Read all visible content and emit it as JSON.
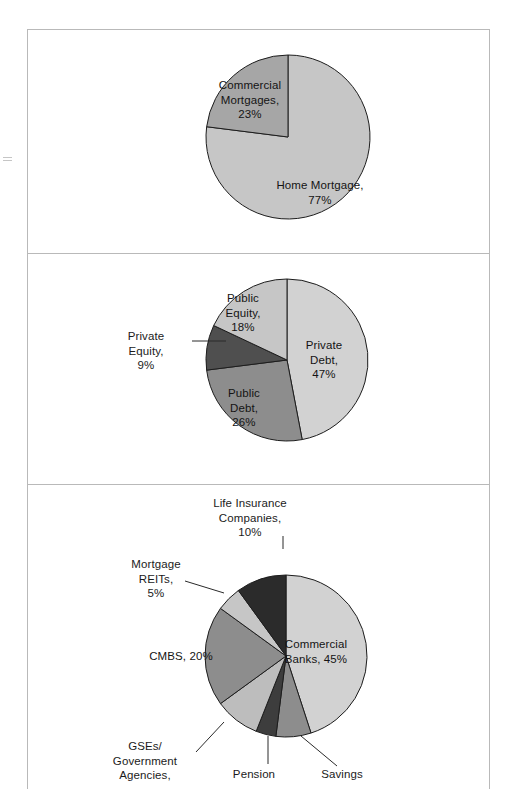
{
  "figure": {
    "background_color": "#ffffff",
    "border_color": "#b9b9b9",
    "panel_count": 3
  },
  "palette": {
    "lightest": "#d2d2d2",
    "light": "#c6c6c6",
    "light_mid": "#bdbdbd",
    "mid": "#a6a6a6",
    "mid_dark": "#8d8d8d",
    "dark": "#6f6f6f",
    "darker": "#4f4f4f",
    "darkest": "#2b2b2b",
    "outline": "#1d1d1d",
    "text": "#1b1b1b"
  },
  "chart_data": [
    {
      "type": "pie",
      "title": "",
      "chart_id": "home-mortgage-vs-commercial",
      "center": [
        260,
        107
      ],
      "radius": 82,
      "start_angle_deg": 0,
      "labels": [
        "Home Mortgage",
        "Commercial Mortgages"
      ],
      "categories": [
        "Home Mortgage",
        "Commercial Mortgages"
      ],
      "values": [
        77,
        23
      ],
      "slices": [
        {
          "label": "Home Mortgage,\n77%",
          "name": "Home Mortgage",
          "value": 77,
          "color": "#c6c6c6",
          "label_position": "inside",
          "label_xy": [
            292,
            148
          ]
        },
        {
          "label": "Commercial\nMortgages,\n23%",
          "name": "Commercial Mortgages",
          "value": 23,
          "color": "#a6a6a6",
          "label_position": "inside",
          "label_xy": [
            222,
            48
          ]
        }
      ]
    },
    {
      "type": "pie",
      "title": "",
      "chart_id": "capital-markets-breakdown",
      "center": [
        259,
        107
      ],
      "radius": 81,
      "start_angle_deg": 0,
      "labels": [
        "Private Debt",
        "Public Debt",
        "Private Equity",
        "Public Equity"
      ],
      "categories": [
        "Private Debt",
        "Public Debt",
        "Private Equity",
        "Public Equity"
      ],
      "values": [
        47,
        26,
        9,
        18
      ],
      "slices": [
        {
          "label": "Private\nDebt,\n47%",
          "name": "Private Debt",
          "value": 47,
          "color": "#d2d2d2",
          "label_position": "inside",
          "label_xy": [
            296,
            85
          ]
        },
        {
          "label": "Public\nDebt,\n26%",
          "name": "Public Debt",
          "value": 26,
          "color": "#8d8d8d",
          "label_position": "inside",
          "label_xy": [
            216,
            133
          ]
        },
        {
          "label": "Private\nEquity,\n9%",
          "name": "Private Equity",
          "value": 9,
          "color": "#4f4f4f",
          "label_position": "outside",
          "label_xy": [
            118,
            76
          ],
          "leader": [
            [
              164,
              88
            ],
            [
              198,
              88
            ]
          ]
        },
        {
          "label": "Public\nEquity,\n18%",
          "name": "Public Equity",
          "value": 18,
          "color": "#c6c6c6",
          "label_position": "inside",
          "label_xy": [
            215,
            38
          ]
        }
      ]
    },
    {
      "type": "pie",
      "title": "",
      "chart_id": "commercial-mortgage-debt-holders",
      "center": [
        258,
        172
      ],
      "radius": 81,
      "start_angle_deg": 0,
      "labels": [
        "Commercial Banks",
        "Savings",
        "Pension",
        "GSEs/Government Agencies",
        "CMBS",
        "Mortgage REITs",
        "Life Insurance Companies"
      ],
      "categories": [
        "Commercial Banks",
        "Savings",
        "Pension",
        "GSEs/Government Agencies",
        "CMBS",
        "Mortgage REITs",
        "Life Insurance Companies"
      ],
      "values": [
        45,
        7,
        4,
        9,
        20,
        5,
        10
      ],
      "slices": [
        {
          "label": "Commercial\nBanks, 45%",
          "name": "Commercial Banks",
          "value": 45,
          "color": "#d2d2d2",
          "label_position": "inside",
          "label_xy": [
            288,
            153
          ]
        },
        {
          "label": "Savings",
          "name": "Savings",
          "value": 7,
          "color": "#8d8d8d",
          "label_position": "outside",
          "label_xy": [
            314,
            283
          ],
          "leader": [
            [
              273,
              252
            ],
            [
              309,
              282
            ]
          ]
        },
        {
          "label": "Pension",
          "name": "Pension",
          "value": 4,
          "color": "#3d3d3d",
          "label_position": "outside",
          "label_xy": [
            226,
            283
          ],
          "leader": [
            [
              240,
              252
            ],
            [
              240,
              280
            ]
          ]
        },
        {
          "label": "GSEs/\nGovernment\nAgencies,",
          "name": "GSEs/Government Agencies",
          "value": 9,
          "color": "#bdbdbd",
          "label_position": "outside",
          "label_xy": [
            117,
            255
          ],
          "leader": [
            [
              196,
              238
            ],
            [
              168,
              268
            ]
          ]
        },
        {
          "label": "CMBS, 20%",
          "name": "CMBS",
          "value": 20,
          "color": "#8d8d8d",
          "label_position": "inside",
          "label_xy": [
            153,
            165
          ]
        },
        {
          "label": "Mortgage\nREITs,\n5%",
          "name": "Mortgage REITs",
          "value": 5,
          "color": "#c6c6c6",
          "label_position": "outside",
          "label_xy": [
            128,
            73
          ],
          "leader": [
            [
              196,
              109
            ],
            [
              157,
              97
            ]
          ]
        },
        {
          "label": "Life Insurance\nCompanies,\n10%",
          "name": "Life Insurance Companies",
          "value": 10,
          "color": "#2b2b2b",
          "label_position": "outside",
          "label_xy": [
            222,
            12
          ],
          "leader": [
            [
              255,
              65
            ],
            [
              255,
              52
            ]
          ]
        }
      ]
    }
  ]
}
